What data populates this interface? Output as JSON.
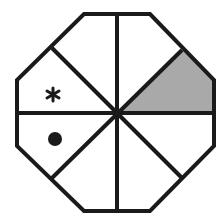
{
  "figure": {
    "type": "octagon-puzzle",
    "colors": {
      "stroke": "#1a1a1a",
      "background": "#ffffff",
      "shaded_fill": "#a9a9a9",
      "marker": "#1a1a1a"
    },
    "sectors": [
      {
        "id": "top-left",
        "shaded": false,
        "marker": null
      },
      {
        "id": "top-right",
        "shaded": false,
        "marker": null
      },
      {
        "id": "right-upper",
        "shaded": true,
        "marker": null
      },
      {
        "id": "right-lower",
        "shaded": false,
        "marker": null
      },
      {
        "id": "bottom-right",
        "shaded": false,
        "marker": null
      },
      {
        "id": "bottom-left",
        "shaded": false,
        "marker": null
      },
      {
        "id": "left-lower",
        "shaded": false,
        "marker": "dot"
      },
      {
        "id": "left-upper",
        "shaded": false,
        "marker": "asterisk"
      }
    ],
    "markers": {
      "asterisk": "*",
      "dot": "●"
    }
  }
}
